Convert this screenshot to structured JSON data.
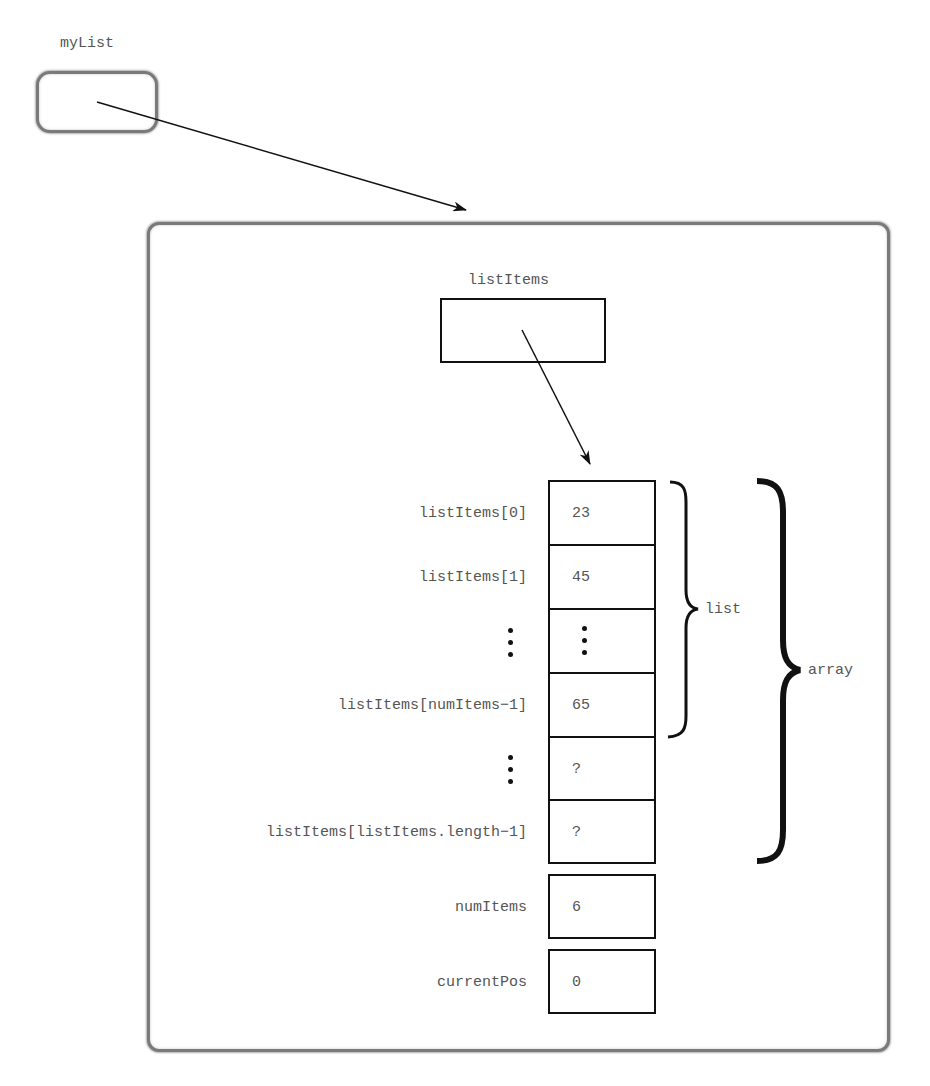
{
  "diagram": {
    "reference_variable": {
      "name": "myList"
    },
    "object": {
      "field_array_ref": {
        "name": "listItems"
      },
      "array_cells": [
        {
          "index_label": "listItems[0]",
          "value": "23"
        },
        {
          "index_label": "listItems[1]",
          "value": "45"
        },
        {
          "index_label": "⋮",
          "value": "⋮",
          "ellipsis": true
        },
        {
          "index_label": "listItems[numItems−1]",
          "value": "65"
        },
        {
          "index_label": "⋮",
          "value": "?",
          "ellipsis_label": true
        },
        {
          "index_label": "listItems[listItems.length−1]",
          "value": "?"
        }
      ],
      "fields": [
        {
          "name": "numItems",
          "value": "6"
        },
        {
          "name": "currentPos",
          "value": "0"
        }
      ]
    },
    "braces": {
      "list": "list",
      "array": "array"
    },
    "colors": {
      "text": "#555555",
      "lines": "#111111",
      "soft_border": "#7a7a7a"
    }
  }
}
